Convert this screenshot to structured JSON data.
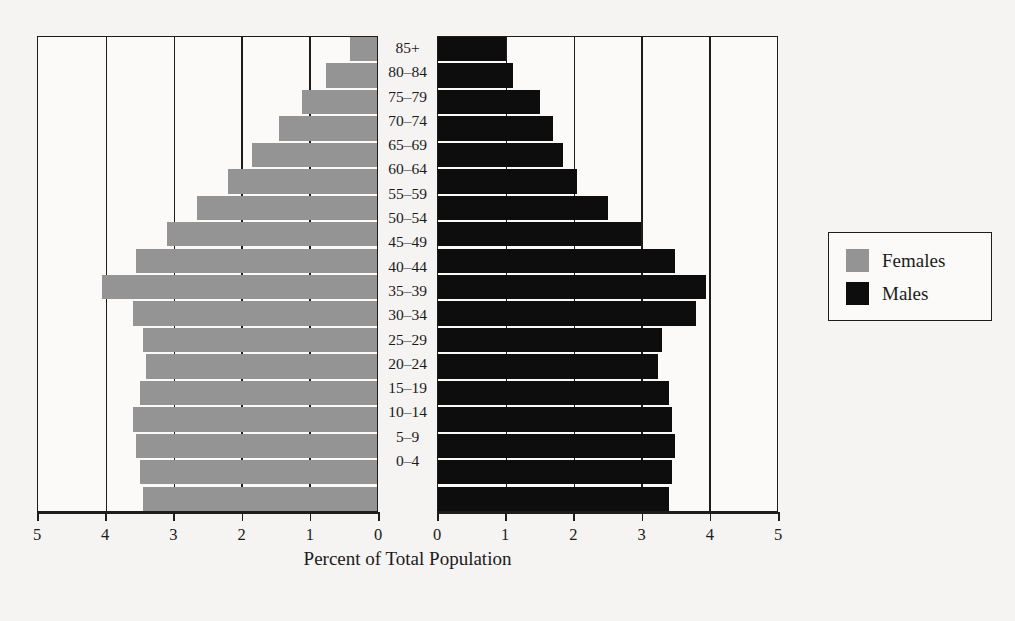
{
  "chart_data": {
    "type": "bar",
    "subtype": "population-pyramid",
    "title": "",
    "xlabel": "Percent of Total Population",
    "ylabel": "",
    "categories": [
      "85+",
      "80–84",
      "75–79",
      "70–74",
      "65–69",
      "60–64",
      "55–59",
      "50–54",
      "45–49",
      "40–44",
      "35–39",
      "30–34",
      "25–29",
      "20–24",
      "15–19",
      "10–14",
      "5–9",
      "0–4"
    ],
    "series": [
      {
        "name": "Females",
        "color": "#949494",
        "side": "left",
        "values": [
          0.4,
          0.75,
          1.1,
          1.45,
          1.85,
          2.2,
          2.65,
          3.1,
          3.55,
          4.05,
          3.6,
          3.45,
          3.4,
          3.5,
          3.6,
          3.55,
          3.5,
          3.45
        ]
      },
      {
        "name": "Males",
        "color": "#0d0d0d",
        "side": "right",
        "values": [
          1.0,
          1.1,
          1.5,
          1.7,
          1.85,
          2.05,
          2.5,
          3.0,
          3.5,
          3.95,
          3.8,
          3.3,
          3.25,
          3.4,
          3.45,
          3.5,
          3.45,
          3.4
        ]
      }
    ],
    "xlim_left": [
      5,
      0
    ],
    "xlim_right": [
      0,
      5
    ],
    "xticks_left": [
      "5",
      "4",
      "3",
      "2",
      "1",
      "0"
    ],
    "xticks_right": [
      "0",
      "1",
      "2",
      "3",
      "4",
      "5"
    ],
    "gridlines": true,
    "grid_values": [
      1,
      2,
      3,
      4
    ],
    "legend_position": "right"
  },
  "axis": {
    "xlabel": "Percent of Total Population",
    "ticks_left": [
      "5",
      "4",
      "3",
      "2",
      "1",
      "0"
    ],
    "ticks_right": [
      "0",
      "1",
      "2",
      "3",
      "4",
      "5"
    ]
  },
  "legend": {
    "entries": [
      {
        "label": "Females",
        "color": "#949494"
      },
      {
        "label": "Males",
        "color": "#0d0d0d"
      }
    ]
  }
}
